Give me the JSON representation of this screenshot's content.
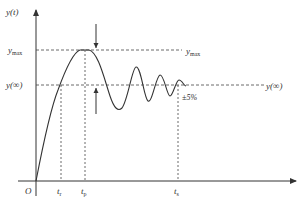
{
  "diagram": {
    "type": "step-response",
    "colors": {
      "stroke": "#333333",
      "dashed": "#444444",
      "background": "#ffffff"
    },
    "axes": {
      "y_label": "y(t)",
      "origin_label": "O"
    },
    "levels": {
      "y_max": {
        "base": "y",
        "sub": "max"
      },
      "y_inf": "y(∞)"
    },
    "time_markers": [
      {
        "id": "t_r",
        "base": "t",
        "sub": "r"
      },
      {
        "id": "t_p",
        "base": "t",
        "sub": "p"
      },
      {
        "id": "t_s",
        "base": "t",
        "sub": "s"
      }
    ],
    "tolerance_label": "±5%"
  }
}
